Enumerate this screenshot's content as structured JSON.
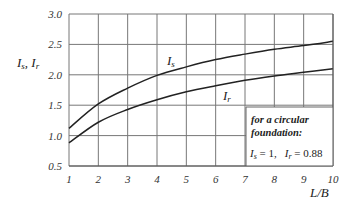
{
  "chart_data": {
    "type": "line",
    "title": "",
    "xlabel": "L/B",
    "ylabel": "I_s, I_r",
    "xlim": [
      1,
      10
    ],
    "ylim": [
      0.5,
      3.0
    ],
    "grid": true,
    "x_ticks": [
      "1",
      "2",
      "3",
      "4",
      "5",
      "6",
      "7",
      "8",
      "9",
      "10"
    ],
    "y_ticks": [
      "0.5",
      "1.0",
      "1.5",
      "2.0",
      "2.5",
      "3.0"
    ],
    "x": [
      1,
      2,
      3,
      4,
      5,
      6,
      7,
      8,
      9,
      10
    ],
    "series": [
      {
        "name": "I_s",
        "values": [
          1.12,
          1.52,
          1.78,
          1.99,
          2.13,
          2.25,
          2.34,
          2.42,
          2.48,
          2.55
        ]
      },
      {
        "name": "I_r",
        "values": [
          0.88,
          1.22,
          1.43,
          1.59,
          1.72,
          1.82,
          1.91,
          1.98,
          2.04,
          2.1
        ]
      }
    ],
    "annotation": {
      "line1": "for a circular",
      "line2": "foundation:",
      "values": "I_s = 1,   I_r = 0.88"
    }
  },
  "labels": {
    "y_axis_main": "I",
    "y_axis_sub1": "s",
    "y_axis_sep": ", I",
    "y_axis_sub2": "r",
    "x_axis": "L/B",
    "series_is": "I",
    "series_is_sub": "s",
    "series_ir": "I",
    "series_ir_sub": "r",
    "note_line1": "for a circular",
    "note_line2": "foundation:",
    "note_is": "I",
    "note_is_sub": "s",
    "note_is_val": " = 1,",
    "note_ir": "I",
    "note_ir_sub": "r",
    "note_ir_val": " = 0.88"
  }
}
